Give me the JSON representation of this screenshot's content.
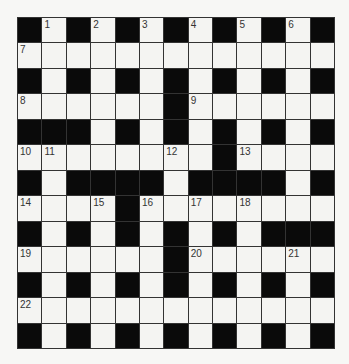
{
  "puzzle": {
    "rows": 13,
    "cols": 13,
    "colors": {
      "block": "#0a0a0a",
      "cell": "#f4f4f2",
      "line": "#333333"
    },
    "grid": [
      "B.B.B.B.B.B.B",
      ".............",
      "B.B.B.B.B.B.B",
      "......B......",
      "BBB.B.B.B.B.B",
      "........B....",
      "B.BBBB.BBBB.B",
      "....B........",
      "B.B.B.B.B.BBB",
      "......B......",
      "B.B.B.B.B.B.B",
      ".............",
      "B.B.B.B.B.B.B"
    ],
    "numbers": [
      {
        "r": 0,
        "c": 1,
        "n": "1"
      },
      {
        "r": 0,
        "c": 3,
        "n": "2"
      },
      {
        "r": 0,
        "c": 5,
        "n": "3"
      },
      {
        "r": 0,
        "c": 7,
        "n": "4"
      },
      {
        "r": 0,
        "c": 9,
        "n": "5"
      },
      {
        "r": 0,
        "c": 11,
        "n": "6"
      },
      {
        "r": 1,
        "c": 0,
        "n": "7"
      },
      {
        "r": 3,
        "c": 0,
        "n": "8"
      },
      {
        "r": 3,
        "c": 7,
        "n": "9"
      },
      {
        "r": 5,
        "c": 0,
        "n": "10"
      },
      {
        "r": 5,
        "c": 1,
        "n": "11"
      },
      {
        "r": 5,
        "c": 6,
        "n": "12"
      },
      {
        "r": 5,
        "c": 9,
        "n": "13"
      },
      {
        "r": 7,
        "c": 0,
        "n": "14"
      },
      {
        "r": 7,
        "c": 3,
        "n": "15"
      },
      {
        "r": 7,
        "c": 5,
        "n": "16"
      },
      {
        "r": 7,
        "c": 7,
        "n": "17"
      },
      {
        "r": 7,
        "c": 9,
        "n": "18"
      },
      {
        "r": 9,
        "c": 0,
        "n": "19"
      },
      {
        "r": 9,
        "c": 7,
        "n": "20"
      },
      {
        "r": 9,
        "c": 11,
        "n": "21"
      },
      {
        "r": 11,
        "c": 0,
        "n": "22"
      }
    ]
  }
}
